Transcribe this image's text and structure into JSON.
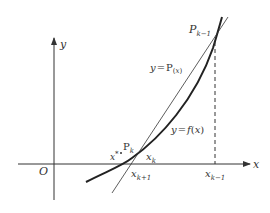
{
  "diagram": {
    "axes": {
      "x_label": "x",
      "y_label": "y",
      "origin_label": "O"
    },
    "curves": {
      "function_label": "y = f(x)",
      "secant_label": "y = P(x)"
    },
    "points": {
      "p_prev": {
        "base": "P",
        "sub": "k−1"
      },
      "p_curr": {
        "base": "P",
        "sub": "k"
      },
      "root": {
        "base": "x",
        "sup": "*"
      }
    },
    "ticks": {
      "x_k": {
        "base": "x",
        "sub": "k"
      },
      "x_k_plus_1": {
        "base": "x",
        "sub": "k+1"
      },
      "x_k_minus_1": {
        "base": "x",
        "sub": "k−1"
      }
    },
    "labels": {
      "fx_y": "y",
      "fx_eq": "=",
      "fx_f": "f",
      "fx_open": "(",
      "fx_x": "x",
      "fx_close": ")",
      "px_y": "y",
      "px_eq": "=",
      "px_P": "P",
      "px_open": "(",
      "px_x": "x",
      "px_close": ")"
    },
    "colors": {
      "stroke": "#333333",
      "background": "#ffffff"
    }
  }
}
